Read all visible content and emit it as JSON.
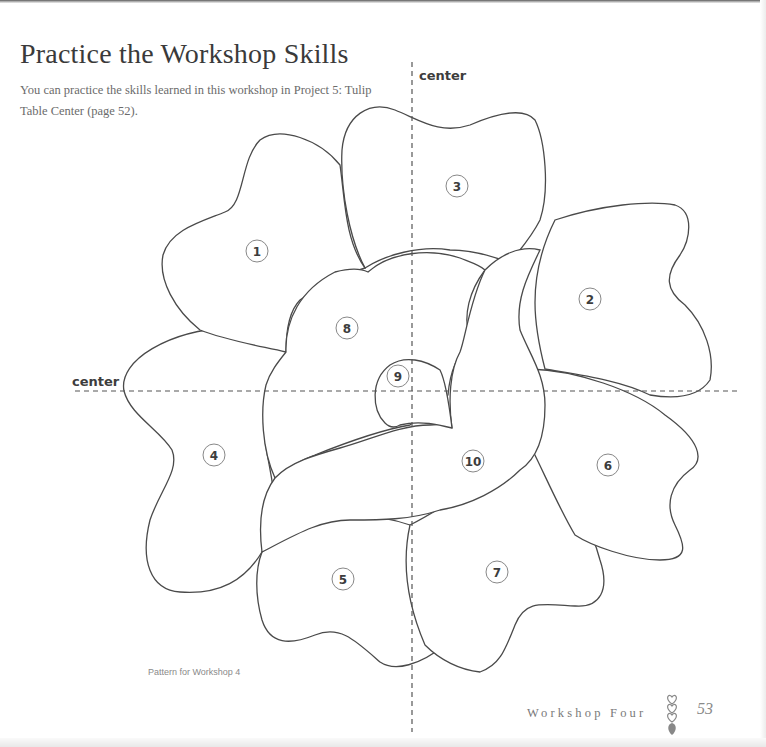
{
  "page": {
    "title": "Practice the Workshop Skills",
    "intro": "You can practice the skills learned in this workshop in Project 5: Tulip Table Center (page 52)."
  },
  "pattern": {
    "caption": "Pattern for Workshop 4",
    "vertical_axis_label": "center",
    "horizontal_axis_label": "center",
    "pieces": [
      {
        "id": "piece-1",
        "label": "1"
      },
      {
        "id": "piece-2",
        "label": "2"
      },
      {
        "id": "piece-3",
        "label": "3"
      },
      {
        "id": "piece-4",
        "label": "4"
      },
      {
        "id": "piece-5",
        "label": "5"
      },
      {
        "id": "piece-6",
        "label": "6"
      },
      {
        "id": "piece-7",
        "label": "7"
      },
      {
        "id": "piece-8",
        "label": "8"
      },
      {
        "id": "piece-9",
        "label": "9"
      },
      {
        "id": "piece-10",
        "label": "10"
      }
    ]
  },
  "footer": {
    "section": "Workshop Four",
    "ornament_icon": "stacked-hearts-icon",
    "page_number": "53"
  }
}
